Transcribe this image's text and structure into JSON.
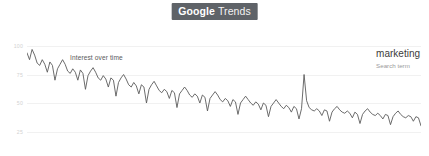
{
  "header": {
    "brand_primary": "Google",
    "brand_secondary": "Trends",
    "badge_color": "#5f6368"
  },
  "chart_panel": {
    "overlay_label": "Interest over time",
    "legend": {
      "term": "marketing",
      "subtitle": "Search term"
    },
    "line_color": "#5b5b5b",
    "grid_color": "#f1f1f1"
  },
  "chart_data": {
    "type": "line",
    "title": "Interest over time",
    "xlabel": "",
    "ylabel": "",
    "ylim": [
      0,
      100
    ],
    "grid": true,
    "legend_position": "top-right",
    "ytick_labels": [
      "100",
      "75",
      "50",
      "25"
    ],
    "ytick_values": [
      100,
      75,
      50,
      25
    ],
    "xtick_labels": [
      "Jan 1, 2004",
      "Sep 1, 2008",
      "May 1, 2013"
    ],
    "xtick_positions": [
      0,
      0.5,
      0.915
    ],
    "annotations": [
      "Interest over time"
    ],
    "series": [
      {
        "name": "marketing",
        "note": "Search term",
        "values": [
          94,
          88,
          97,
          92,
          85,
          83,
          88,
          84,
          77,
          86,
          83,
          70,
          80,
          84,
          88,
          84,
          78,
          76,
          80,
          77,
          70,
          79,
          76,
          62,
          74,
          78,
          81,
          77,
          72,
          70,
          74,
          71,
          64,
          72,
          70,
          56,
          68,
          72,
          75,
          71,
          66,
          64,
          68,
          65,
          58,
          66,
          64,
          50,
          62,
          66,
          69,
          65,
          61,
          59,
          62,
          60,
          54,
          61,
          59,
          46,
          58,
          61,
          64,
          61,
          57,
          55,
          58,
          56,
          50,
          57,
          55,
          43,
          54,
          57,
          60,
          57,
          53,
          51,
          54,
          52,
          47,
          53,
          51,
          40,
          50,
          53,
          56,
          53,
          50,
          48,
          51,
          49,
          44,
          50,
          48,
          38,
          47,
          50,
          53,
          50,
          47,
          45,
          48,
          46,
          42,
          47,
          45,
          36,
          45,
          75,
          52,
          46,
          44,
          43,
          45,
          43,
          39,
          44,
          43,
          34,
          42,
          45,
          47,
          44,
          42,
          41,
          43,
          41,
          37,
          42,
          40,
          32,
          40,
          43,
          45,
          42,
          40,
          39,
          41,
          39,
          36,
          40,
          39,
          31,
          38,
          41,
          43,
          40,
          38,
          37,
          39,
          38,
          34,
          38,
          37,
          30
        ]
      }
    ]
  }
}
